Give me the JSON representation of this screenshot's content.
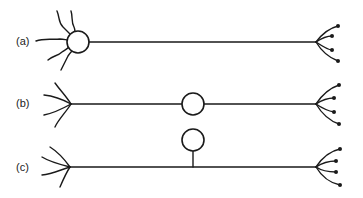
{
  "diagram": {
    "type": "neuron-morphology-types",
    "colors": {
      "line": "#1a1a1a",
      "background": "#ffffff"
    },
    "panels": [
      {
        "id": "a",
        "label": "(a)",
        "description": "multipolar: dendrites attach to soma, axon leaves soma"
      },
      {
        "id": "b",
        "label": "(b)",
        "description": "bipolar: soma positioned mid-axon"
      },
      {
        "id": "c",
        "label": "(c)",
        "description": "unipolar: soma on a stalk off the axon"
      }
    ]
  }
}
